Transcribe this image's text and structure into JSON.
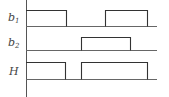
{
  "diagram": {
    "type": "timing-diagram",
    "signals": [
      {
        "name": "b",
        "subscript": "1",
        "pulses": [
          [
            26,
            66
          ],
          [
            105,
            147
          ]
        ]
      },
      {
        "name": "b",
        "subscript": "2",
        "pulses": [
          [
            81,
            130
          ]
        ]
      },
      {
        "name": "H",
        "subscript": "",
        "pulses": [
          [
            26,
            65
          ],
          [
            81,
            147
          ]
        ]
      }
    ]
  }
}
